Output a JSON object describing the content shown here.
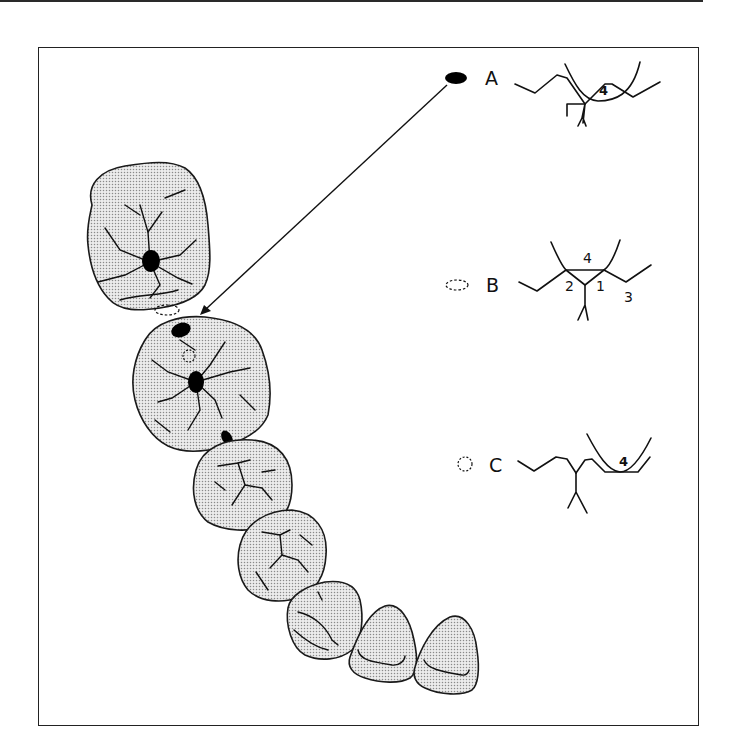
{
  "figure": {
    "colors": {
      "line": "#111111",
      "stipple": "#9a9a9a",
      "background": "#ffffff"
    }
  },
  "legend": [
    {
      "id": "A",
      "label": "A",
      "marker": "solid-ellipse",
      "cusp_numbers": [
        "4"
      ]
    },
    {
      "id": "B",
      "label": "B",
      "marker": "dashed-ellipse",
      "cusp_numbers": [
        "4",
        "2",
        "1",
        "3"
      ]
    },
    {
      "id": "C",
      "label": "C",
      "marker": "dashed-circle",
      "cusp_numbers": [
        "4"
      ]
    }
  ],
  "teeth": [
    {
      "name": "second-molar"
    },
    {
      "name": "first-molar"
    },
    {
      "name": "second-premolar"
    },
    {
      "name": "first-premolar"
    },
    {
      "name": "canine"
    },
    {
      "name": "lateral-incisor"
    },
    {
      "name": "central-incisor"
    }
  ]
}
